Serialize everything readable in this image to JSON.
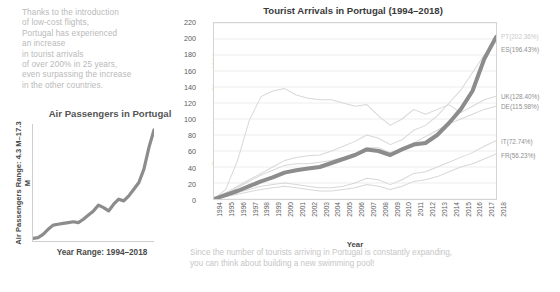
{
  "annotation": {
    "text": "Thanks to the introduction\nof low-cost flights,\nPortugal has experienced\nan increase\nin tourist arrivals\nof over 200% in 25 years,\neven surpassing the increase\nin the other countries."
  },
  "caption": {
    "text": "Since the number of tourists arriving in Portugal is constantly expanding,\nyou can think about building a new swimming pool!"
  },
  "sparkline": {
    "title": "Air Passengers in Portugal",
    "ylabel": "Air Passengers Range: 4.3 M–17.3 M",
    "xlabel": "Year Range: 1994–2018"
  },
  "main": {
    "title": "Tourist Arrivals in Portugal (1994–2018)",
    "xlabel": "Year",
    "ylabel": "Percentage Increase Since 1994"
  },
  "colors": {
    "highlight": "#8c8c8c",
    "muted": "#d8d8d8",
    "muted_label": "#c9c9c9",
    "dark_label": "#8f8f8f",
    "grid": "#eeeeee",
    "axis": "#d4d4d4",
    "annotation_text": "#b9b9b9"
  },
  "chart_data": {
    "type": "line",
    "title": "Tourist Arrivals in Portugal (1994–2018)",
    "xlabel": "Year",
    "ylabel": "Percentage Increase Since 1994",
    "grid": true,
    "legend": "right-edge-labels",
    "ylim": [
      0,
      220
    ],
    "yticks": [
      0,
      20,
      40,
      60,
      80,
      100,
      120,
      140,
      160,
      180,
      200,
      220
    ],
    "x": [
      1994,
      1995,
      1996,
      1997,
      1998,
      1999,
      2000,
      2001,
      2002,
      2003,
      2004,
      2005,
      2006,
      2007,
      2008,
      2009,
      2010,
      2011,
      2012,
      2013,
      2014,
      2015,
      2016,
      2017,
      2018
    ],
    "series": [
      {
        "name": "PT",
        "label": "PT(202.36%)",
        "final_value": 202.36,
        "highlight": true,
        "values": [
          0,
          5,
          10,
          16,
          22,
          27,
          33,
          36,
          38,
          40,
          45,
          50,
          55,
          62,
          60,
          55,
          62,
          68,
          70,
          80,
          95,
          112,
          135,
          175,
          202.36
        ]
      },
      {
        "name": "ES",
        "label": "ES(196.43%)",
        "final_value": 196.43,
        "highlight": false,
        "values": [
          0,
          8,
          16,
          24,
          32,
          40,
          48,
          52,
          54,
          55,
          60,
          66,
          72,
          80,
          76,
          68,
          74,
          86,
          92,
          104,
          120,
          136,
          158,
          180,
          196.43
        ]
      },
      {
        "name": "UK",
        "label": "UK(128.40%)",
        "final_value": 128.4,
        "highlight": false,
        "values": [
          0,
          12,
          48,
          98,
          128,
          135,
          138,
          130,
          126,
          124,
          124,
          120,
          116,
          118,
          104,
          92,
          100,
          112,
          106,
          112,
          118,
          108,
          116,
          124,
          128.4
        ]
      },
      {
        "name": "DE",
        "label": "DE(115.98%)",
        "final_value": 115.98,
        "highlight": false,
        "values": [
          0,
          6,
          14,
          22,
          30,
          36,
          42,
          44,
          44,
          46,
          48,
          52,
          56,
          64,
          64,
          58,
          62,
          70,
          78,
          86,
          94,
          100,
          106,
          112,
          115.98
        ]
      },
      {
        "name": "IT",
        "label": "IT(72.74%)",
        "final_value": 72.74,
        "highlight": false,
        "values": [
          0,
          4,
          8,
          12,
          16,
          18,
          20,
          18,
          16,
          14,
          14,
          16,
          20,
          26,
          24,
          18,
          24,
          32,
          34,
          40,
          46,
          52,
          58,
          66,
          72.74
        ]
      },
      {
        "name": "FR",
        "label": "FR(56.23%)",
        "final_value": 56.23,
        "highlight": false,
        "values": [
          0,
          3,
          6,
          9,
          12,
          14,
          16,
          14,
          12,
          10,
          10,
          12,
          14,
          18,
          16,
          12,
          16,
          22,
          24,
          28,
          34,
          40,
          44,
          50,
          56.23
        ]
      }
    ]
  },
  "spark_data": {
    "type": "line",
    "title": "Air Passengers in Portugal",
    "ylabel": "Air Passengers Range: 4.3 M–17.3 M",
    "xlabel": "Year Range: 1994–2018",
    "x": [
      1994,
      1995,
      1996,
      1997,
      1998,
      1999,
      2000,
      2001,
      2002,
      2003,
      2004,
      2005,
      2006,
      2007,
      2008,
      2009,
      2010,
      2011,
      2012,
      2013,
      2014,
      2015,
      2016,
      2017,
      2018
    ],
    "values": [
      4.3,
      4.4,
      4.8,
      5.4,
      5.9,
      6.0,
      6.1,
      6.2,
      6.3,
      6.2,
      6.6,
      7.1,
      7.6,
      8.3,
      8.0,
      7.6,
      8.4,
      9.0,
      8.8,
      9.4,
      10.2,
      11.0,
      12.6,
      15.2,
      17.3
    ],
    "ylim": [
      4.0,
      18.0
    ]
  }
}
